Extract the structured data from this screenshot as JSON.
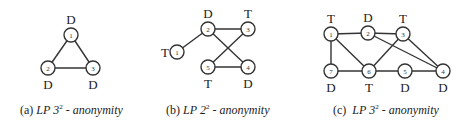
{
  "figure": {
    "panels": [
      {
        "id": "a",
        "caption": {
          "prefix": "(a)",
          "lp": "LP",
          "base": "3",
          "exponent": "2",
          "suffix": "- anonymity"
        },
        "nodes": [
          {
            "id": "1",
            "x": 71,
            "y": 35,
            "label": "D",
            "label_pos": "above"
          },
          {
            "id": "2",
            "x": 48,
            "y": 68,
            "label": "D",
            "label_pos": "below"
          },
          {
            "id": "3",
            "x": 93,
            "y": 68,
            "label": "D",
            "label_pos": "below"
          }
        ],
        "edges": [
          [
            "1",
            "2"
          ],
          [
            "1",
            "3"
          ],
          [
            "2",
            "3"
          ]
        ]
      },
      {
        "id": "b",
        "caption": {
          "prefix": "(b)",
          "lp": "LP",
          "base": "2",
          "exponent": "2",
          "suffix": "- anonymity"
        },
        "nodes": [
          {
            "id": "1",
            "x": 177,
            "y": 52,
            "label": "T",
            "label_pos": "left"
          },
          {
            "id": "2",
            "x": 208,
            "y": 29,
            "label": "D",
            "label_pos": "above"
          },
          {
            "id": "3",
            "x": 248,
            "y": 29,
            "label": "T",
            "label_pos": "above"
          },
          {
            "id": "4",
            "x": 248,
            "y": 67,
            "label": "D",
            "label_pos": "below"
          },
          {
            "id": "5",
            "x": 208,
            "y": 67,
            "label": "T",
            "label_pos": "below"
          }
        ],
        "edges": [
          [
            "1",
            "2"
          ],
          [
            "2",
            "3"
          ],
          [
            "2",
            "4"
          ],
          [
            "3",
            "5"
          ],
          [
            "5",
            "4"
          ]
        ]
      },
      {
        "id": "c",
        "caption": {
          "prefix": "(c)",
          "lp": "LP",
          "base": "3",
          "exponent": "2",
          "suffix": "- anonymity"
        },
        "nodes": [
          {
            "id": "1",
            "x": 331,
            "y": 34,
            "label": "T",
            "label_pos": "above"
          },
          {
            "id": "2",
            "x": 368,
            "y": 33,
            "label": "D",
            "label_pos": "above"
          },
          {
            "id": "3",
            "x": 403,
            "y": 34,
            "label": "T",
            "label_pos": "above"
          },
          {
            "id": "4",
            "x": 443,
            "y": 71,
            "label": "D",
            "label_pos": "below"
          },
          {
            "id": "5",
            "x": 405,
            "y": 71,
            "label": "D",
            "label_pos": "below"
          },
          {
            "id": "6",
            "x": 369,
            "y": 71,
            "label": "T",
            "label_pos": "below"
          },
          {
            "id": "7",
            "x": 331,
            "y": 71,
            "label": "D",
            "label_pos": "below"
          }
        ],
        "edges": [
          [
            "1",
            "2"
          ],
          [
            "2",
            "3"
          ],
          [
            "1",
            "7"
          ],
          [
            "1",
            "6"
          ],
          [
            "7",
            "6"
          ],
          [
            "6",
            "3"
          ],
          [
            "6",
            "5"
          ],
          [
            "5",
            "4"
          ],
          [
            "2",
            "4"
          ],
          [
            "3",
            "4"
          ]
        ]
      }
    ],
    "style": {
      "node_radius": 7,
      "stroke_color": "#333333",
      "text_color": "#222222"
    }
  }
}
